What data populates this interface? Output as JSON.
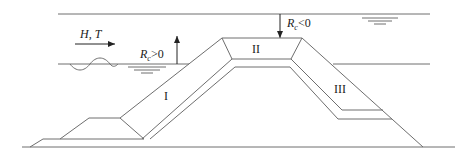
{
  "diagram": {
    "title": "",
    "type": "breakwater cross-section with freeboard definitions",
    "colors": {
      "line": "#6e6e6e",
      "text": "#222222",
      "background": "#ffffff"
    },
    "labels": {
      "wave": "H, T",
      "rc_positive_main": "R",
      "rc_positive_sub": "c",
      "rc_positive_rel": ">0",
      "rc_negative_main": "R",
      "rc_negative_sub": "c",
      "rc_negative_rel": "<0",
      "zone_1": "I",
      "zone_2": "II",
      "zone_3": "III"
    },
    "elements": [
      {
        "name": "upper-water-level",
        "description": "Water level above crest (submerged case)"
      },
      {
        "name": "lower-water-level",
        "description": "Water level below crest (emerged case)"
      },
      {
        "name": "wave-direction-arrow",
        "description": "Incident wave H, T"
      },
      {
        "name": "freeboard-positive-arrow",
        "description": "Rc > 0 upward"
      },
      {
        "name": "freeboard-negative-arrow",
        "description": "Rc < 0 downward"
      },
      {
        "name": "zone-I",
        "description": "Seaward slope"
      },
      {
        "name": "zone-II",
        "description": "Crest"
      },
      {
        "name": "zone-III",
        "description": "Leeward slope"
      }
    ]
  }
}
